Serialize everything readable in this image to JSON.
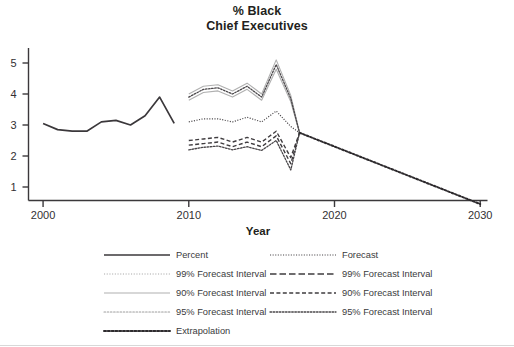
{
  "chart_data": {
    "type": "line",
    "title": "% Black Chief Executives",
    "title_line1": "% Black",
    "title_line2": "Chief Executives",
    "xlabel": "Year",
    "ylabel": "",
    "xlim": [
      1999,
      2030.5
    ],
    "ylim": [
      0,
      5.6
    ],
    "xticks": [
      "2000",
      "2010",
      "2020",
      "2030"
    ],
    "xtick_values": [
      2000,
      2010,
      2020,
      2030
    ],
    "yticks": [
      "1",
      "2",
      "3",
      "4",
      "5"
    ],
    "ytick_values": [
      1,
      2,
      3,
      4,
      5
    ],
    "grid": false,
    "legend_position": "below-plot",
    "series": [
      {
        "name": "Percent",
        "style": "solid-dark",
        "x": [
          2000,
          2001,
          2002,
          2003,
          2004,
          2005,
          2006,
          2007,
          2008,
          2009
        ],
        "values": [
          3.05,
          2.85,
          2.8,
          2.8,
          3.1,
          3.15,
          3.0,
          3.3,
          3.9,
          3.05
        ]
      },
      {
        "name": "Forecast",
        "style": "dotted-fine-dark",
        "x": [
          2010,
          2011,
          2012,
          2013,
          2014,
          2015,
          2016,
          2017,
          2017.6
        ],
        "values": [
          3.1,
          3.2,
          3.2,
          3.1,
          3.25,
          3.1,
          3.45,
          2.95,
          2.75
        ]
      },
      {
        "name": "99% Forecast Interval Upper",
        "style": "solid-light",
        "x": [
          2010,
          2011,
          2012,
          2013,
          2014,
          2015,
          2016,
          2017,
          2017.6
        ],
        "values": [
          4.0,
          4.25,
          4.3,
          4.1,
          4.35,
          4.0,
          5.1,
          3.95,
          2.75
        ]
      },
      {
        "name": "99% Forecast Interval Lower",
        "style": "dashed-dark",
        "x": [
          2010,
          2011,
          2012,
          2013,
          2014,
          2015,
          2016,
          2017,
          2017.6
        ],
        "values": [
          2.35,
          2.4,
          2.45,
          2.3,
          2.45,
          2.3,
          2.65,
          1.75,
          2.75
        ]
      },
      {
        "name": "90% Forecast Interval Upper",
        "style": "solid-light",
        "x": [
          2010,
          2011,
          2012,
          2013,
          2014,
          2015,
          2016,
          2017,
          2017.6
        ],
        "values": [
          3.8,
          4.05,
          4.1,
          3.9,
          4.15,
          3.8,
          4.8,
          3.75,
          2.75
        ]
      },
      {
        "name": "90% Forecast Interval Lower",
        "style": "dashed-dark",
        "x": [
          2010,
          2011,
          2012,
          2013,
          2014,
          2015,
          2016,
          2017,
          2017.6
        ],
        "values": [
          2.5,
          2.55,
          2.6,
          2.45,
          2.6,
          2.45,
          2.8,
          1.95,
          2.75
        ]
      },
      {
        "name": "95% Forecast Interval Upper",
        "style": "dotted-dark",
        "x": [
          2010,
          2011,
          2012,
          2013,
          2014,
          2015,
          2016,
          2017,
          2017.6
        ],
        "values": [
          3.9,
          4.15,
          4.2,
          4.0,
          4.25,
          3.9,
          4.95,
          3.85,
          2.75
        ]
      },
      {
        "name": "95% Forecast Interval Lower",
        "style": "dotted-dark",
        "x": [
          2010,
          2011,
          2012,
          2013,
          2014,
          2015,
          2016,
          2017,
          2017.6
        ],
        "values": [
          2.2,
          2.28,
          2.32,
          2.2,
          2.3,
          2.18,
          2.5,
          1.55,
          2.75
        ]
      },
      {
        "name": "Extrapolation",
        "style": "dotted-bold-dark",
        "x": [
          2017.6,
          2030
        ],
        "values": [
          2.75,
          0.45
        ]
      }
    ]
  },
  "axis": {
    "x_title": "Year",
    "x_tick_labels": [
      "2000",
      "2010",
      "2020",
      "2030"
    ],
    "y_tick_labels": [
      "5",
      "4",
      "3",
      "2",
      "1"
    ]
  },
  "legend": {
    "column_left": [
      {
        "label": "Percent",
        "style": "solid-dark"
      },
      {
        "label": "99% Forecast Interval",
        "style": "dotted-fine-light"
      },
      {
        "label": "90% Forecast Interval",
        "style": "solid-light"
      },
      {
        "label": "95% Forecast Interval",
        "style": "dotted-light"
      },
      {
        "label": "Extrapolation",
        "style": "dotted-bold-dark"
      }
    ],
    "column_right": [
      {
        "label": "Forecast",
        "style": "dotted-fine-dark"
      },
      {
        "label": "99% Forecast Interval",
        "style": "dashed-long-dark"
      },
      {
        "label": "90% Forecast Interval",
        "style": "dashed-dark"
      },
      {
        "label": "95% Forecast Interval",
        "style": "dotted-dark"
      }
    ]
  },
  "colors": {
    "ink": "#231f20",
    "axis": "#3b383b",
    "light_line": "#a8a8a8",
    "mid_line": "#6f6f6f",
    "rule": "#d8d8d8"
  }
}
